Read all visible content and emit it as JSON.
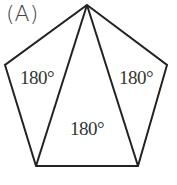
{
  "figure": {
    "title": "(A)",
    "shape": "pentagon",
    "vertices": [
      [
        87,
        5
      ],
      [
        167,
        65
      ],
      [
        138,
        166
      ],
      [
        36,
        166
      ],
      [
        5,
        65
      ]
    ],
    "diagonals": [
      [
        [
          87,
          5
        ],
        [
          36,
          166
        ]
      ],
      [
        [
          87,
          5
        ],
        [
          138,
          166
        ]
      ]
    ],
    "triangles": [
      {
        "label": "180°",
        "position": "left"
      },
      {
        "label": "180°",
        "position": "center"
      },
      {
        "label": "180°",
        "position": "right"
      }
    ],
    "stroke_color": "#222222"
  }
}
